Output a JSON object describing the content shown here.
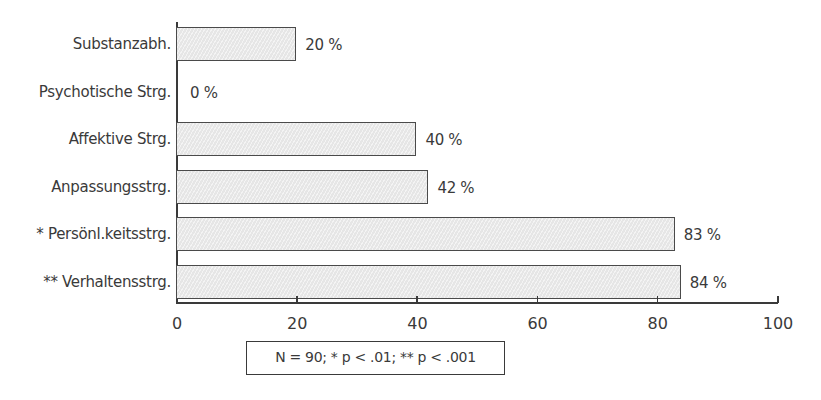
{
  "chart_data": {
    "type": "bar",
    "orientation": "horizontal",
    "title": "",
    "xlabel": "",
    "ylabel": "",
    "categories": [
      "Substanzabh.",
      "Psychotische Strg.",
      "Affektive Strg.",
      "Anpassungsstrg.",
      "* Persönl.keitsstrg.",
      "** Verhaltensstrg."
    ],
    "values": [
      20,
      0,
      40,
      42,
      83,
      84
    ],
    "value_labels": [
      "20 %",
      "0 %",
      "40 %",
      "42 %",
      "83 %",
      "84 %"
    ],
    "unit": "%",
    "xlim": [
      0,
      100
    ],
    "x_ticks": [
      0,
      20,
      40,
      60,
      80,
      100
    ],
    "x_tick_labels": [
      "0",
      "20",
      "40",
      "60",
      "80",
      "100"
    ],
    "grid": false,
    "legend": null,
    "annotation": "N = 90; * p < .01; ** p < .001",
    "bar_fill": "#e6e6e6",
    "bar_pattern": "diagonal-hatch",
    "bar_border": "#4a4a4a"
  }
}
